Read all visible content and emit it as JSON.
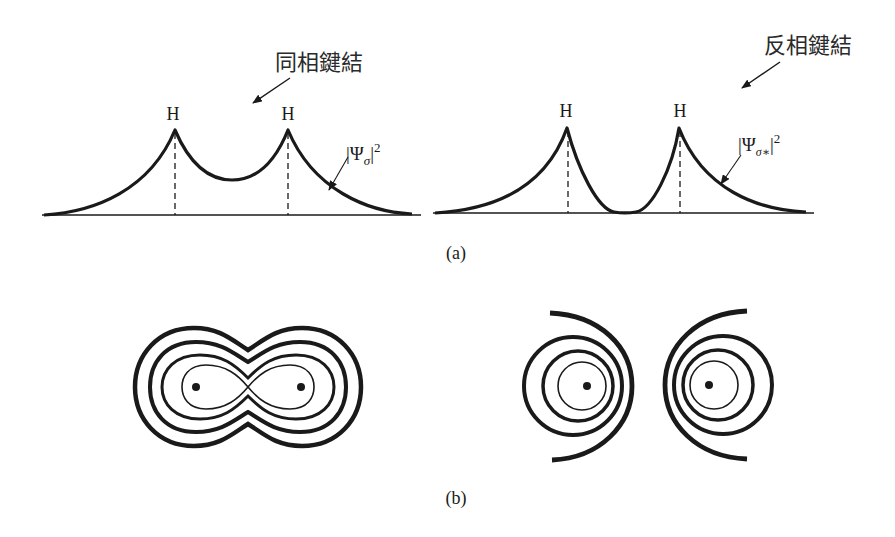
{
  "panel_a": {
    "caption": "(a)",
    "bonding": {
      "title": "同相鍵結",
      "atom_left": "H",
      "atom_right": "H",
      "density_label": {
        "bar_open": "|",
        "psi": "Ψ",
        "subscript": "σ",
        "bar_close": "|",
        "power": "2"
      }
    },
    "antibonding": {
      "title": "反相鍵結",
      "atom_left": "H",
      "atom_right": "H",
      "density_label": {
        "bar_open": "|",
        "psi": "Ψ",
        "subscript": "σ∗",
        "bar_close": "|",
        "power": "2"
      }
    }
  },
  "panel_b": {
    "caption": "(b)"
  },
  "colors": {
    "ink": "#1a1a1a",
    "background": "#ffffff"
  }
}
